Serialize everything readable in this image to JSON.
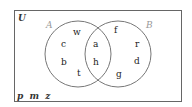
{
  "diagram": {
    "type": "venn",
    "universal_label": "U",
    "sets": [
      {
        "name": "A",
        "cx": 78,
        "cy": 53,
        "r": 33
      },
      {
        "name": "B",
        "cx": 118,
        "cy": 53,
        "r": 33
      }
    ],
    "regions": {
      "A_only": [
        "w",
        "c",
        "b",
        "t"
      ],
      "A_and_B": [
        "a",
        "h"
      ],
      "B_only": [
        "f",
        "r",
        "d",
        "g"
      ],
      "outside": "p  m  z"
    },
    "colors": {
      "border": "#666666",
      "circle": "#777777",
      "set_label": "#999999",
      "text": "#222222"
    }
  },
  "labels": {
    "U": "U",
    "A": "A",
    "B": "B",
    "w": "w",
    "c": "c",
    "b": "b",
    "t": "t",
    "a": "a",
    "h": "h",
    "f": "f",
    "r": "r",
    "d": "d",
    "g": "g",
    "outside": "p  m  z"
  }
}
